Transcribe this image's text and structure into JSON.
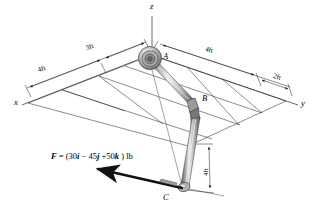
{
  "figure": {
    "type": "engineering-statics-diagram",
    "axes": {
      "x_label": "x",
      "y_label": "y",
      "z_label": "z"
    },
    "points": {
      "a_label": "A",
      "b_label": "B",
      "c_label": "C"
    },
    "dimensions": [
      {
        "key": "left_outer",
        "text": "4ft"
      },
      {
        "key": "left_inner",
        "text": "3ft"
      },
      {
        "key": "right_outer",
        "text": "4ft"
      },
      {
        "key": "right_inner",
        "text": "2ft"
      },
      {
        "key": "vertical_bc",
        "text": "4ft"
      }
    ],
    "force": {
      "symbol": "F",
      "equals": "=",
      "open_paren": "(",
      "i_coefficient": "30",
      "i_unit": "i",
      "minus": "−",
      "j_coefficient": "45",
      "j_unit": "j",
      "plus": "+",
      "k_coefficient": "50",
      "k_unit": "k",
      "close_paren": ")",
      "units": "lb",
      "full_text": "F = (30i − 45j + 50k ) lb"
    },
    "colors": {
      "line": "#1a1a1a",
      "rod_light": "#e8e8e8",
      "rod_mid": "#b8b8b8",
      "rod_dark": "#6e6e6e",
      "grid": "#2b2b2b",
      "background": "#ffffff"
    }
  }
}
